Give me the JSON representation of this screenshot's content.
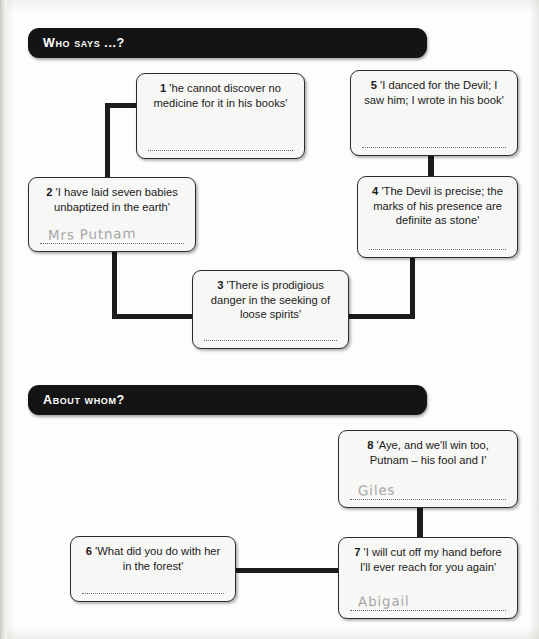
{
  "sections": [
    {
      "id": "who-says",
      "banner_label": "Who says ...?",
      "boxes": [
        {
          "number": "1",
          "quote": "'he cannot discover no medicine for it in his books'",
          "answer": ""
        },
        {
          "number": "2",
          "quote": "'I have laid seven babies unbaptized in the earth'",
          "answer": "Mrs Putnam"
        },
        {
          "number": "3",
          "quote": "'There is prodigious danger in the seeking of loose spirits'",
          "answer": ""
        },
        {
          "number": "4",
          "quote": "'The Devil is precise; the marks of his presence are definite as stone'",
          "answer": ""
        },
        {
          "number": "5",
          "quote": "'I danced for the Devil; I saw him; I wrote in his book'",
          "answer": ""
        }
      ]
    },
    {
      "id": "about-whom",
      "banner_label": "About whom?",
      "boxes": [
        {
          "number": "6",
          "quote": "'What did you do with her in the forest'",
          "answer": ""
        },
        {
          "number": "7",
          "quote": "'I will cut off my hand before I'll ever reach for you again'",
          "answer": "Abigail"
        },
        {
          "number": "8",
          "quote": "'Aye, and we'll win too, Putnam – his fool and I'",
          "answer": "Giles"
        }
      ]
    }
  ],
  "colors": {
    "banner_background": "#141414",
    "banner_text": "#ffffff",
    "box_background": "#f7f7f5",
    "box_border": "#2b2b2b",
    "connector": "#1c1c1c",
    "handwriting": "#9a9a9a",
    "answer_line": "#6b6b6b"
  }
}
